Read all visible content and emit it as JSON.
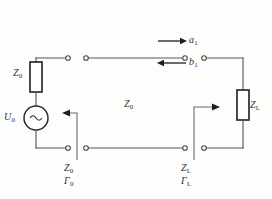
{
  "diagram": {
    "type": "circuit-schematic",
    "width": 272,
    "height": 199,
    "background_color": "#fdfdfb",
    "wire_color": "#58595b",
    "component_color": "#2b2b2b",
    "text_color": "#333333"
  },
  "labels": {
    "source_impedance": "Z",
    "source_impedance_sub": "0",
    "source_voltage": "U",
    "source_voltage_sub": "0",
    "line_impedance": "Z",
    "line_impedance_sub": "0",
    "load_impedance": "Z",
    "load_impedance_sub": "L",
    "incident_wave": "a",
    "incident_wave_sub": "1",
    "reflected_wave": "b",
    "reflected_wave_sub": "1",
    "port0_impedance": "Z",
    "port0_impedance_sub": "0",
    "port0_reflection": "Γ",
    "port0_reflection_sub": "0",
    "portL_impedance": "Z",
    "portL_impedance_sub": "L",
    "portL_reflection": "Γ",
    "portL_reflection_sub": "L"
  },
  "components": [
    {
      "name": "source-series-impedance",
      "label": "Z0",
      "kind": "resistor",
      "orientation": "vertical"
    },
    {
      "name": "voltage-source",
      "label": "U0",
      "kind": "ac-source",
      "orientation": "vertical"
    },
    {
      "name": "load-impedance",
      "label": "ZL",
      "kind": "resistor",
      "orientation": "vertical"
    },
    {
      "name": "transmission-line",
      "label": "Z0",
      "kind": "two-wire-line",
      "orientation": "horizontal"
    }
  ],
  "arrows": [
    {
      "name": "incident-wave-arrow",
      "label": "a1",
      "direction": "right"
    },
    {
      "name": "reflected-wave-arrow",
      "label": "b1",
      "direction": "left"
    },
    {
      "name": "source-reference-arrow",
      "label": "Z0 / Γ0",
      "direction": "left"
    },
    {
      "name": "load-reference-arrow",
      "label": "ZL / ΓL",
      "direction": "right"
    }
  ],
  "terminals": {
    "count": 8,
    "description": "open-circle terminal pairs at the source port and the load port"
  }
}
